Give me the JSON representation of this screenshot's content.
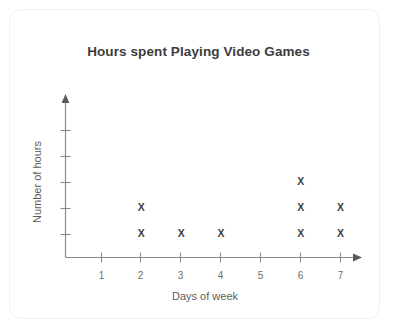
{
  "card": {
    "background": "#ffffff",
    "border_color": "#f0f0f0"
  },
  "chart_data": {
    "type": "scatter",
    "plot_style": "dot-plot",
    "title": "Hours spent Playing Video Games",
    "xlabel": "Days of week",
    "ylabel": "Number of hours",
    "categories": [
      "1",
      "2",
      "3",
      "4",
      "5",
      "6",
      "7"
    ],
    "x": [
      1,
      2,
      3,
      4,
      5,
      6,
      7
    ],
    "values": [
      0,
      2,
      1,
      1,
      0,
      3,
      2
    ],
    "marker": "X",
    "marker_color": "#3f3f3f",
    "xlim": [
      0,
      7.6
    ],
    "ylim": [
      0,
      5
    ],
    "x_tick_labels": [
      "1",
      "2",
      "3",
      "4",
      "5",
      "6",
      "7"
    ],
    "y_tick_labels": [
      "",
      "",
      "",
      "",
      ""
    ],
    "y_ticks_count": 5,
    "grid": false,
    "legend": false,
    "axis_color": "#8a8a8a",
    "axis_arrows": true,
    "points": [
      {
        "day": "1",
        "count": 0,
        "stack": []
      },
      {
        "day": "2",
        "count": 2,
        "stack": [
          1,
          2
        ]
      },
      {
        "day": "3",
        "count": 1,
        "stack": [
          1
        ]
      },
      {
        "day": "4",
        "count": 1,
        "stack": [
          1
        ]
      },
      {
        "day": "5",
        "count": 0,
        "stack": []
      },
      {
        "day": "6",
        "count": 3,
        "stack": [
          1,
          2,
          3
        ]
      },
      {
        "day": "7",
        "count": 2,
        "stack": [
          1,
          2
        ]
      }
    ]
  }
}
